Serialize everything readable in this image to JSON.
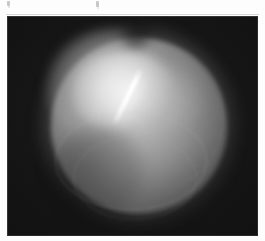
{
  "page": {
    "background_color": "#fdfdfd",
    "kind": "scanned-figure-plate"
  },
  "artifacts": {
    "note": "two faint clipped descender marks along the very top edge of the scan",
    "color": "#9a9a9a"
  },
  "figure": {
    "name": "retroillumination-photograph",
    "caption": "",
    "frame": {
      "left_px": 7,
      "top_px": 16,
      "width_px": 251,
      "height_px": 220,
      "background_color": "#111111",
      "border_color": "#2a2a2a"
    },
    "subject": {
      "label": "",
      "description_semantic": "globe",
      "center_x_px": 132,
      "center_y_px": 110,
      "diameter_px": 176,
      "base_color": "#8e8e8e",
      "rim_color": "#222222"
    },
    "features": [
      {
        "name": "nuclear-opacity-core",
        "highlight_color": "#f2f2f2",
        "center_x_px": 118,
        "center_y_px": 77,
        "width_px": 104,
        "height_px": 82
      },
      {
        "name": "linear-streak-opacity",
        "highlight_color": "#ffffff",
        "angle_deg": 26,
        "length_px": 62,
        "start_x_px": 150,
        "start_y_px": 72,
        "end_x_px": 124,
        "end_y_px": 118
      },
      {
        "name": "secondary-bloom",
        "highlight_color": "#dedede",
        "center_x_px": 155,
        "center_y_px": 83
      },
      {
        "name": "inferior-wedge-shadow",
        "shadow_color": "#000000",
        "center_x_px": 90,
        "center_y_px": 157
      },
      {
        "name": "superior-pole-notch",
        "shadow_color": "#000000",
        "center_x_px": 129,
        "center_y_px": 19
      }
    ],
    "grain": {
      "name": "film-grain",
      "opacity": 0.3
    }
  },
  "chart_data": {
    "type": "heatmap",
    "title": "",
    "xlabel": "",
    "ylabel": "",
    "note": "grayscale photographic plate; intensity map rather than plotted data",
    "intensity_range": [
      0,
      255
    ],
    "legend": []
  }
}
